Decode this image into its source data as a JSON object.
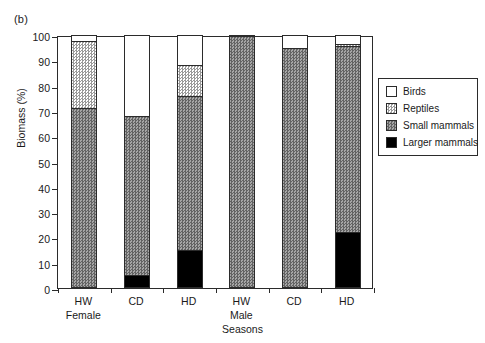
{
  "panel": {
    "label": "(b)"
  },
  "axes": {
    "ylabel": "Biomass (%)",
    "xlabel": "Seasons",
    "yticks": [
      "0",
      "10",
      "20",
      "30",
      "40",
      "50",
      "60",
      "70",
      "80",
      "90",
      "100"
    ]
  },
  "groups": [
    {
      "name": "Female"
    },
    {
      "name": "Male"
    }
  ],
  "legend": {
    "items": [
      {
        "label": "Birds",
        "swatch": "white-swatch",
        "color": "#ffffff"
      },
      {
        "label": "Reptiles",
        "swatch": "light-hatch-swatch",
        "color": "#c8c8c8"
      },
      {
        "label": "Small mammals",
        "swatch": "dark-hatch-swatch",
        "color": "#8d8d8d"
      },
      {
        "label": "Larger mammals",
        "swatch": "black-swatch",
        "color": "#000000"
      }
    ]
  },
  "chart_data": {
    "type": "bar",
    "title": "(b)",
    "xlabel": "Seasons",
    "ylabel": "Biomass (%)",
    "ylim": [
      0,
      100
    ],
    "ytick_step": 10,
    "grid": false,
    "stacked": true,
    "legend_position": "right",
    "categories": [
      "HW",
      "CD",
      "HD",
      "HW",
      "CD",
      "HD"
    ],
    "group_labels": [
      "Female",
      "Female",
      "Female",
      "Male",
      "Male",
      "Male"
    ],
    "series": [
      {
        "name": "Larger mammals",
        "values": [
          0,
          5,
          15,
          0,
          0,
          22
        ]
      },
      {
        "name": "Small mammals",
        "values": [
          71,
          63,
          61,
          99.5,
          95,
          73.5
        ]
      },
      {
        "name": "Reptiles",
        "values": [
          26.5,
          0,
          12,
          0,
          0,
          1
        ]
      },
      {
        "name": "Birds",
        "values": [
          2.5,
          32,
          12,
          0.5,
          5,
          3.5
        ]
      }
    ],
    "cumulative_tops": {
      "Larger mammals": [
        0,
        5,
        15,
        0,
        0,
        22
      ],
      "Small mammals": [
        71,
        68,
        76,
        99.5,
        95,
        95.5
      ],
      "Reptiles": [
        97.5,
        68,
        88,
        99.5,
        95,
        96.5
      ],
      "Birds": [
        100,
        100,
        100,
        100,
        100,
        100
      ]
    }
  }
}
